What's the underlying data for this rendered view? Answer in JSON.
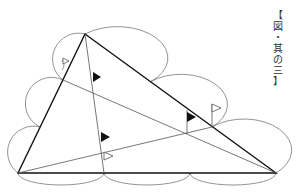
{
  "caption": {
    "chars": [
      "【",
      "図",
      "・",
      "其",
      "の",
      "三",
      "】"
    ]
  },
  "diagram": {
    "line_color": "#111111",
    "arc_color": "#777777",
    "vertices": {
      "top": [
        85,
        34
      ],
      "bottom_left": [
        18,
        173
      ],
      "bottom_right": [
        276,
        173
      ]
    },
    "division_points": {
      "left_side": [
        [
          63,
          80
        ],
        [
          40,
          127
        ]
      ],
      "right_side": [
        [
          150,
          82
        ],
        [
          212,
          127
        ]
      ],
      "bottom": [
        [
          104,
          173
        ],
        [
          190,
          173
        ]
      ]
    },
    "flags": [
      {
        "type": "filled",
        "x": 93,
        "y": 72
      },
      {
        "type": "filled",
        "x": 187,
        "y": 112
      },
      {
        "type": "filled",
        "x": 101,
        "y": 132
      },
      {
        "type": "outline",
        "x": 212,
        "y": 104
      },
      {
        "type": "outline",
        "x": 104,
        "y": 152
      },
      {
        "type": "outline",
        "x": 63,
        "y": 58
      }
    ]
  }
}
